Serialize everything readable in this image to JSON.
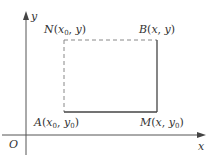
{
  "diagram": {
    "origin_label": "O",
    "x_axis_label": "x",
    "y_axis_label": "y",
    "points": {
      "A": {
        "name": "A",
        "x": "x",
        "x_sub": "0",
        "y": "y",
        "y_sub": "0"
      },
      "B": {
        "name": "B",
        "x": "x",
        "y": "y"
      },
      "M": {
        "name": "M",
        "x": "x",
        "y": "y",
        "y_sub": "0"
      },
      "N": {
        "name": "N",
        "x": "x",
        "x_sub": "0",
        "y": "y"
      }
    },
    "colors": {
      "axis": "#555555",
      "solid_edge": "#444444",
      "dashed_edge": "#888888",
      "text": "#333333"
    }
  }
}
